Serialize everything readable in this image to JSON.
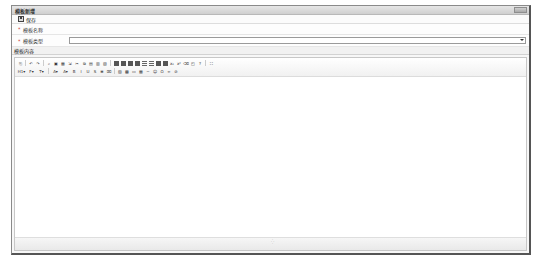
{
  "window": {
    "title": "模板新增",
    "control_label": "关闭"
  },
  "actionbar": {
    "save_label": "保存"
  },
  "form": {
    "name": {
      "required_mark": "*",
      "label": "模板名称",
      "value": ""
    },
    "type": {
      "required_mark": "*",
      "label": "模板类型",
      "value": ""
    }
  },
  "content": {
    "header": "模板内容"
  },
  "editor": {
    "toolbar_row1": [
      {
        "icon": "source-icon",
        "glyph": "⎘"
      },
      {
        "sep": true
      },
      {
        "icon": "undo-icon",
        "glyph": "↶"
      },
      {
        "icon": "redo-icon",
        "glyph": "↷"
      },
      {
        "sep": true
      },
      {
        "icon": "find-icon",
        "glyph": "⌕"
      },
      {
        "icon": "image-icon",
        "glyph": "▣"
      },
      {
        "icon": "table-icon",
        "glyph": "▦"
      },
      {
        "icon": "pagebreak-icon",
        "glyph": "⇲"
      },
      {
        "icon": "cut-icon",
        "glyph": "✂"
      },
      {
        "icon": "copy-icon",
        "glyph": "⧉"
      },
      {
        "icon": "paste-icon",
        "glyph": "▤"
      },
      {
        "icon": "paste-text-icon",
        "glyph": "▥"
      },
      {
        "icon": "paste-word-icon",
        "glyph": "▧"
      },
      {
        "sep": true
      },
      {
        "icon": "align-left-icon",
        "block": "dark"
      },
      {
        "icon": "align-center-icon",
        "block": "dark"
      },
      {
        "icon": "align-right-icon",
        "block": "dark"
      },
      {
        "icon": "align-justify-icon",
        "block": "dark"
      },
      {
        "icon": "ordered-list-icon",
        "block": "lines"
      },
      {
        "icon": "unordered-list-icon",
        "block": "lines"
      },
      {
        "icon": "indent-icon",
        "block": "dark"
      },
      {
        "icon": "outdent-icon",
        "block": "dark"
      },
      {
        "icon": "subscript-icon",
        "glyph": "x₂"
      },
      {
        "icon": "superscript-icon",
        "glyph": "x²"
      },
      {
        "icon": "clear-format-icon",
        "glyph": "⌫"
      },
      {
        "icon": "select-all-icon",
        "glyph": "◰"
      },
      {
        "icon": "help-icon",
        "glyph": "?"
      },
      {
        "sep": true
      },
      {
        "icon": "fullscreen-icon",
        "glyph": "⛶"
      }
    ],
    "toolbar_row2": [
      {
        "icon": "heading-dropdown-icon",
        "glyph": "H1▾",
        "dd": true
      },
      {
        "icon": "font-family-dropdown-icon",
        "glyph": "F▾",
        "dd": true
      },
      {
        "icon": "font-size-dropdown-icon",
        "glyph": "T▾",
        "dd": true
      },
      {
        "sep": true
      },
      {
        "icon": "font-color-icon",
        "glyph": "A▾",
        "dd": true
      },
      {
        "icon": "highlight-icon",
        "glyph": "A▾",
        "dd": true
      },
      {
        "icon": "bold-icon",
        "glyph": "B"
      },
      {
        "icon": "italic-icon",
        "glyph": "I"
      },
      {
        "icon": "underline-icon",
        "glyph": "U"
      },
      {
        "icon": "strikethrough-icon",
        "glyph": "S"
      },
      {
        "icon": "line-height-icon",
        "glyph": "≡"
      },
      {
        "icon": "remove-format-icon",
        "glyph": "⌧"
      },
      {
        "sep": true
      },
      {
        "icon": "insert-image-icon",
        "glyph": "▨"
      },
      {
        "icon": "insert-flash-icon",
        "glyph": "▩"
      },
      {
        "icon": "insert-media-icon",
        "glyph": "▭"
      },
      {
        "icon": "insert-table-icon",
        "glyph": "▦"
      },
      {
        "icon": "horizontal-line-icon",
        "glyph": "─"
      },
      {
        "icon": "emoticon-icon",
        "glyph": "☺"
      },
      {
        "icon": "special-char-icon",
        "glyph": "Ω"
      },
      {
        "icon": "link-icon",
        "glyph": "∞"
      },
      {
        "icon": "unlink-icon",
        "glyph": "⊘"
      }
    ],
    "resize_handle": "⁛"
  }
}
